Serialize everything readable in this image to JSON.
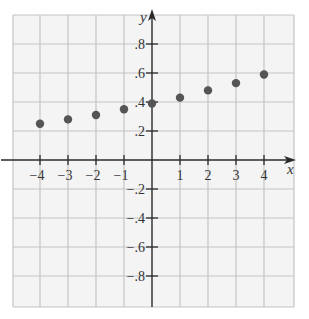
{
  "chart_data": {
    "type": "scatter",
    "title": "",
    "xlabel": "x",
    "ylabel": "y",
    "xlim": [
      -5,
      5
    ],
    "ylim": [
      -1,
      1
    ],
    "grid": true,
    "legend": null,
    "x_ticks": [
      -4,
      -3,
      -2,
      -1,
      1,
      2,
      3,
      4
    ],
    "x_tick_labels": [
      "−4",
      "−3",
      "−2",
      "−1",
      "1",
      "2",
      "3",
      "4"
    ],
    "y_ticks": [
      0.8,
      0.6,
      0.4,
      0.2,
      -0.2,
      -0.4,
      -0.6,
      -0.8
    ],
    "y_tick_labels": [
      ".8",
      ".6",
      ".4",
      ".2",
      "−.2",
      "−.4",
      "−.6",
      "−.8"
    ],
    "series": [
      {
        "name": "points",
        "x": [
          -4,
          -3,
          -2,
          -1,
          0,
          1,
          2,
          3,
          4
        ],
        "y": [
          0.25,
          0.28,
          0.31,
          0.35,
          0.39,
          0.43,
          0.48,
          0.53,
          0.59
        ]
      }
    ]
  },
  "style": {
    "grid_color": "#c4c4c4",
    "axis_color": "#2a2a2a",
    "point_color": "#555555",
    "background": "#f4f4f4"
  }
}
